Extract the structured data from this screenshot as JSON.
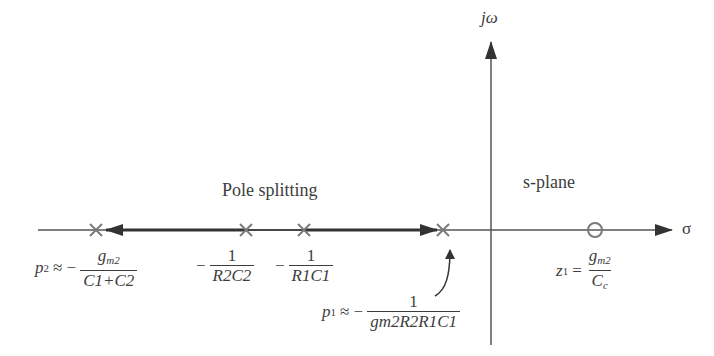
{
  "diagram": {
    "title": "Pole splitting",
    "plane_label": "s-plane",
    "axes": {
      "vertical_label": "jω",
      "horizontal_label": "σ"
    },
    "poles": [
      {
        "id": "p2",
        "name": "p",
        "sub": "2",
        "relation": "≈ −",
        "num_main": "g",
        "num_sub": "m2",
        "den": "C1+C2"
      },
      {
        "id": "r2c2",
        "prefix": "−",
        "num": "1",
        "den": "R2C2"
      },
      {
        "id": "r1c1",
        "prefix": "−",
        "num": "1",
        "den": "R1C1"
      },
      {
        "id": "p1",
        "name": "p",
        "sub": "1",
        "relation": "≈ −",
        "num": "1",
        "den": "gm2R2R1C1"
      }
    ],
    "zero": {
      "name": "z",
      "sub": "1",
      "relation": "=",
      "num_main": "g",
      "num_sub": "m2",
      "den_main": "C",
      "den_sub": "c"
    },
    "colors": {
      "line": "#3a3a3a",
      "marker": "#7a7a7a"
    }
  }
}
